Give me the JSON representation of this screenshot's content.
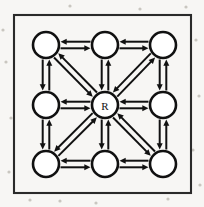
{
  "figure": {
    "kind": "directed-graph-diagram",
    "background_color": "#f7f6f4",
    "ink_color": "#111111",
    "frame": {
      "name": "outer-border",
      "stroke_color": "#2a2a2a",
      "x": 14,
      "y": 15,
      "width": 177,
      "height": 178
    },
    "node_radius": 13,
    "nodes": [
      {
        "id": "n-top-left",
        "label": "",
        "cx": 46,
        "cy": 45,
        "row": 0,
        "col": 0
      },
      {
        "id": "n-top-center",
        "label": "",
        "cx": 105,
        "cy": 45,
        "row": 0,
        "col": 1
      },
      {
        "id": "n-top-right",
        "label": "",
        "cx": 163,
        "cy": 45,
        "row": 0,
        "col": 2
      },
      {
        "id": "n-middle-left",
        "label": "",
        "cx": 46,
        "cy": 105,
        "row": 1,
        "col": 0
      },
      {
        "id": "n-center",
        "label": "R",
        "cx": 105,
        "cy": 105,
        "row": 1,
        "col": 1
      },
      {
        "id": "n-middle-right",
        "label": "",
        "cx": 163,
        "cy": 105,
        "row": 1,
        "col": 2
      },
      {
        "id": "n-bottom-left",
        "label": "",
        "cx": 46,
        "cy": 164,
        "row": 2,
        "col": 0
      },
      {
        "id": "n-bottom-center",
        "label": "",
        "cx": 105,
        "cy": 164,
        "row": 2,
        "col": 1
      },
      {
        "id": "n-bottom-right",
        "label": "",
        "cx": 163,
        "cy": 164,
        "row": 2,
        "col": 2
      }
    ],
    "edges": [
      {
        "id": "e-tl-tc",
        "from": "n-top-left",
        "to": "n-top-center",
        "orientation": "horizontal",
        "bidirectional": true
      },
      {
        "id": "e-tc-tr",
        "from": "n-top-center",
        "to": "n-top-right",
        "orientation": "horizontal",
        "bidirectional": true
      },
      {
        "id": "e-ml-c",
        "from": "n-middle-left",
        "to": "n-center",
        "orientation": "horizontal",
        "bidirectional": true
      },
      {
        "id": "e-c-mr",
        "from": "n-center",
        "to": "n-middle-right",
        "orientation": "horizontal",
        "bidirectional": true
      },
      {
        "id": "e-bl-bc",
        "from": "n-bottom-left",
        "to": "n-bottom-center",
        "orientation": "horizontal",
        "bidirectional": true
      },
      {
        "id": "e-bc-br",
        "from": "n-bottom-center",
        "to": "n-bottom-right",
        "orientation": "horizontal",
        "bidirectional": true
      },
      {
        "id": "e-tl-ml",
        "from": "n-top-left",
        "to": "n-middle-left",
        "orientation": "vertical",
        "bidirectional": true
      },
      {
        "id": "e-ml-bl",
        "from": "n-middle-left",
        "to": "n-bottom-left",
        "orientation": "vertical",
        "bidirectional": true
      },
      {
        "id": "e-tc-c",
        "from": "n-top-center",
        "to": "n-center",
        "orientation": "vertical",
        "bidirectional": true
      },
      {
        "id": "e-c-bc",
        "from": "n-center",
        "to": "n-bottom-center",
        "orientation": "vertical",
        "bidirectional": true
      },
      {
        "id": "e-tr-mr",
        "from": "n-top-right",
        "to": "n-middle-right",
        "orientation": "vertical",
        "bidirectional": true
      },
      {
        "id": "e-mr-br",
        "from": "n-middle-right",
        "to": "n-bottom-right",
        "orientation": "vertical",
        "bidirectional": true
      },
      {
        "id": "e-tl-c",
        "from": "n-top-left",
        "to": "n-center",
        "orientation": "diagonal",
        "bidirectional": true
      },
      {
        "id": "e-tr-c",
        "from": "n-top-right",
        "to": "n-center",
        "orientation": "diagonal",
        "bidirectional": true
      },
      {
        "id": "e-bl-c",
        "from": "n-bottom-left",
        "to": "n-center",
        "orientation": "diagonal",
        "bidirectional": true
      },
      {
        "id": "e-br-c",
        "from": "n-bottom-right",
        "to": "n-center",
        "orientation": "diagonal",
        "bidirectional": true
      }
    ]
  }
}
